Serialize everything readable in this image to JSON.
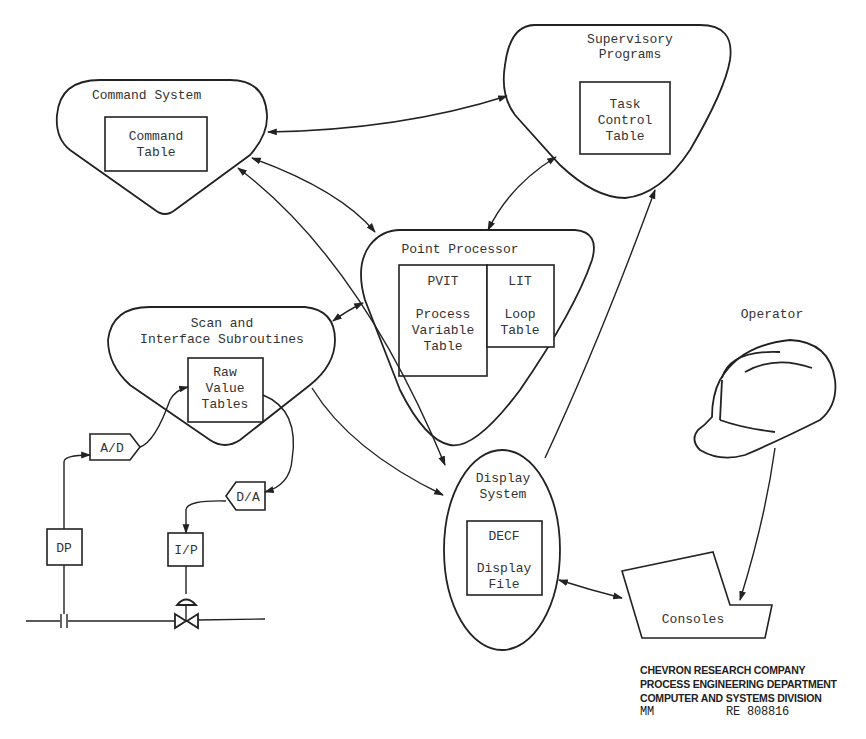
{
  "diagram": {
    "nodes": {
      "command_system": {
        "title": "Command System",
        "table": [
          "Command",
          "Table"
        ]
      },
      "supervisory_programs": {
        "title": [
          "Supervisory",
          "Programs"
        ],
        "table": [
          "Task",
          "Control",
          "Table"
        ]
      },
      "point_processor": {
        "title": "Point Processor",
        "pvit": {
          "code": "PVIT",
          "label": [
            "Process",
            "Variable",
            "Table"
          ]
        },
        "lit": {
          "code": "LIT",
          "label": [
            "Loop",
            "Table"
          ]
        }
      },
      "scan_interface": {
        "title": [
          "Scan and",
          "Interface Subroutines"
        ],
        "table": [
          "Raw",
          "Value",
          "Tables"
        ]
      },
      "display_system": {
        "title": [
          "Display",
          "System"
        ],
        "code": "DECF",
        "table": [
          "Display",
          "File"
        ]
      },
      "ad": "A/D",
      "da": "D/A",
      "dp": "DP",
      "ip": "I/P",
      "operator": "Operator",
      "consoles": "Consoles"
    },
    "edges": [
      {
        "from": "Command System",
        "to": "Supervisory Programs"
      },
      {
        "from": "Command System",
        "to": "Point Processor",
        "bidirectional": true
      },
      {
        "from": "Command System",
        "to": "Display System",
        "bidirectional": true
      },
      {
        "from": "Point Processor",
        "to": "Supervisory Programs",
        "bidirectional": true
      },
      {
        "from": "Scan and Interface Subroutines",
        "to": "Point Processor",
        "bidirectional": true
      },
      {
        "from": "Scan and Interface Subroutines",
        "to": "Display System"
      },
      {
        "from": "Display System",
        "to": "Supervisory Programs"
      },
      {
        "from": "A/D",
        "to": "Raw Value Tables"
      },
      {
        "from": "Raw Value Tables",
        "to": "D/A"
      },
      {
        "from": "DP",
        "to": "A/D"
      },
      {
        "from": "D/A",
        "to": "I/P"
      },
      {
        "from": "Display System",
        "to": "Consoles",
        "bidirectional": true
      },
      {
        "from": "Operator",
        "to": "Consoles"
      }
    ]
  },
  "credit": {
    "line1": "CHEVRON RESEARCH COMPANY",
    "line2": "PROCESS ENGINEERING DEPARTMENT",
    "line3": "COMPUTER AND SYSTEMS DIVISION",
    "initials": "MM",
    "ref": "RE 808816"
  }
}
